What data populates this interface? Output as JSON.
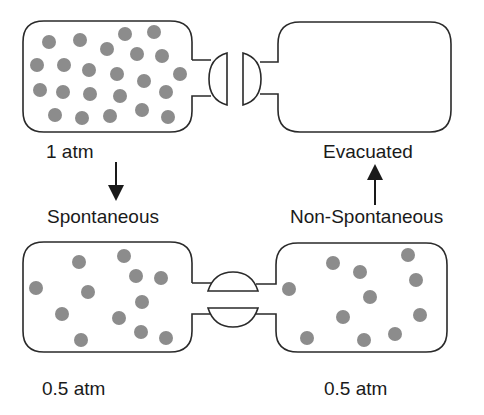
{
  "diagram": {
    "type": "gas-expansion-flasks",
    "colors": {
      "molecule": "#8c8c8c",
      "outline": "#2a2a2a",
      "text": "#1a1a1a",
      "background": "#ffffff"
    },
    "top_state": {
      "left_flask": {
        "label": "1 atm",
        "molecules": [
          [
            49,
            42
          ],
          [
            80,
            40
          ],
          [
            125,
            34
          ],
          [
            154,
            32
          ],
          [
            107,
            49
          ],
          [
            137,
            54
          ],
          [
            162,
            56
          ],
          [
            37,
            65
          ],
          [
            64,
            65
          ],
          [
            89,
            70
          ],
          [
            117,
            74
          ],
          [
            144,
            81
          ],
          [
            180,
            74
          ],
          [
            40,
            90
          ],
          [
            63,
            92
          ],
          [
            90,
            94
          ],
          [
            120,
            96
          ],
          [
            166,
            92
          ],
          [
            55,
            115
          ],
          [
            82,
            118
          ],
          [
            110,
            116
          ],
          [
            142,
            110
          ],
          [
            168,
            117
          ]
        ]
      },
      "right_flask": {
        "label": "Evacuated",
        "molecules": []
      },
      "valve_state": "closed"
    },
    "bottom_state": {
      "left_flask": {
        "label": "0.5 atm",
        "molecules": [
          [
            79,
            262
          ],
          [
            124,
            256
          ],
          [
            136,
            276
          ],
          [
            161,
            278
          ],
          [
            36,
            288
          ],
          [
            88,
            292
          ],
          [
            142,
            302
          ],
          [
            62,
            314
          ],
          [
            119,
            318
          ],
          [
            141,
            332
          ],
          [
            166,
            338
          ],
          [
            81,
            340
          ]
        ]
      },
      "right_flask": {
        "label": "0.5 atm",
        "molecules": [
          [
            333,
            263
          ],
          [
            360,
            272
          ],
          [
            408,
            255
          ],
          [
            416,
            280
          ],
          [
            289,
            289
          ],
          [
            370,
            297
          ],
          [
            343,
            317
          ],
          [
            420,
            315
          ],
          [
            307,
            338
          ],
          [
            364,
            340
          ],
          [
            395,
            334
          ]
        ]
      },
      "valve_state": "open"
    },
    "arrows": [
      {
        "label": "Spontaneous",
        "direction": "down",
        "from": "top",
        "to": "bottom"
      },
      {
        "label": "Non-Spontaneous",
        "direction": "up",
        "from": "bottom",
        "to": "top"
      }
    ]
  }
}
